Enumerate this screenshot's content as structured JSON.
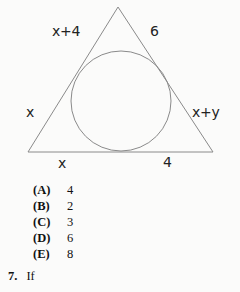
{
  "figure": {
    "name": "triangle-with-inscribed-circle",
    "stroke_color": "#8a8a8a",
    "background_color": "#fbfbfa",
    "triangle": {
      "apex": [
        118,
        7
      ],
      "bottom_left": [
        28,
        152
      ],
      "bottom_right": [
        213,
        152
      ]
    },
    "circle": {
      "center": [
        121,
        101
      ],
      "radius": 50
    },
    "labels": {
      "upper_left_side": "x+4",
      "upper_right_side": "6",
      "lower_left_side": "x",
      "lower_right_side": "x+y",
      "base_left": "x",
      "base_right": "4"
    }
  },
  "choices": [
    {
      "letter": "(A)",
      "value": "4"
    },
    {
      "letter": "(B)",
      "value": "2"
    },
    {
      "letter": "(C)",
      "value": "3"
    },
    {
      "letter": "(D)",
      "value": "6"
    },
    {
      "letter": "(E)",
      "value": "8"
    }
  ],
  "next_question": {
    "number": "7.",
    "text": "If"
  }
}
